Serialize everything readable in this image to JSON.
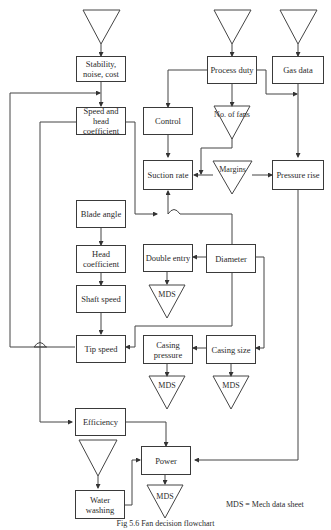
{
  "nodes": {
    "stability": "Stability, noise, cost",
    "process_duty": "Process duty",
    "gas_data": "Gas data",
    "speed_head": "Speed and head coefficient",
    "control": "Control",
    "no_fans": "No. of fans",
    "suction_rate": "Suction rate",
    "margins": "Margins",
    "pressure_rise": "Pressure rise",
    "blade_angle": "Blade angle",
    "head_coeff": "Head coefficient",
    "shaft_speed": "Shaft speed",
    "double_entry": "Double entry",
    "diameter": "Diameter",
    "tip_speed": "Tip speed",
    "casing_pressure": "Casing pressure",
    "casing_size": "Casing size",
    "efficiency": "Efficiency",
    "power": "Power",
    "water_washing": "Water washing",
    "mds": "MDS"
  },
  "legend": "MDS = Mech data sheet",
  "caption": "Fig 5.6   Fan decision flowchart"
}
